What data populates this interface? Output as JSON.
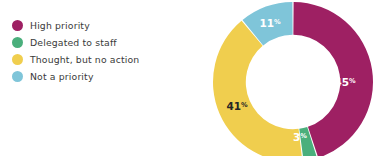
{
  "colors": {
    "high_priority": "#9e2063",
    "delegated": "#4aaf7c",
    "thought_no_action": "#f0ce4e",
    "not_a_priority": "#7fc5d9",
    "label_light": "#ffffff",
    "label_dark": "#262626",
    "legend_text": "#3a3a3a",
    "background": "#ffffff"
  },
  "legend": {
    "position": "left",
    "items": [
      {
        "label": "High priority",
        "color_key": "high_priority",
        "swatch": "circle-swatch"
      },
      {
        "label": "Delegated to staff",
        "color_key": "delegated",
        "swatch": "circle-swatch"
      },
      {
        "label": "Thought, but no action",
        "color_key": "thought_no_action",
        "swatch": "circle-swatch"
      },
      {
        "label": "Not a priority",
        "color_key": "not_a_priority",
        "swatch": "circle-swatch"
      }
    ]
  },
  "chart_data": {
    "type": "pie",
    "variant": "donut",
    "title": "",
    "subtitle": "",
    "xlabel": "",
    "ylabel": "",
    "grid": false,
    "legend_position": "left",
    "start_angle_deg": 0,
    "direction": "clockwise",
    "inner_radius_ratio": 0.59,
    "labels_suffix": "%",
    "categories": [
      "High priority",
      "Delegated to staff",
      "Thought, but no action",
      "Not a priority"
    ],
    "values": [
      45,
      3,
      41,
      11
    ],
    "slices": [
      {
        "name": "High priority",
        "value": 45,
        "display": "45",
        "suffix": "%",
        "color": "#9e2063",
        "label_color": "#ffffff",
        "label_x": 152,
        "label_y": 88
      },
      {
        "name": "Delegated to staff",
        "value": 3,
        "display": "3",
        "suffix": "%",
        "color": "#4aaf7c",
        "label_color": "#ffffff",
        "label_x": 107,
        "label_y": 143
      },
      {
        "name": "Thought, but no action",
        "value": 41,
        "display": "41",
        "suffix": "%",
        "color": "#f0ce4e",
        "label_color": "#262626",
        "label_x": 44,
        "label_y": 112
      },
      {
        "name": "Not a priority",
        "value": 11,
        "display": "11",
        "suffix": "%",
        "color": "#7fc5d9",
        "label_color": "#ffffff",
        "label_x": 77,
        "label_y": 29
      }
    ]
  }
}
